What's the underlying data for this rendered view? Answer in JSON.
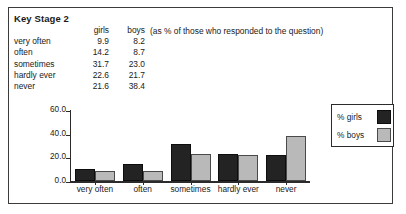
{
  "title": "Key Stage 2",
  "note": "(as % of those who responded to the question)",
  "table": {
    "headers": [
      "",
      "girls",
      "boys"
    ],
    "rows": [
      {
        "label": "very often",
        "girls": "9.9",
        "boys": "8.2"
      },
      {
        "label": "often",
        "girls": "14.2",
        "boys": "8.7"
      },
      {
        "label": "sometimes",
        "girls": "31.7",
        "boys": "23.0"
      },
      {
        "label": "hardly ever",
        "girls": "22.6",
        "boys": "21.7"
      },
      {
        "label": "never",
        "girls": "21.6",
        "boys": "38.4"
      }
    ]
  },
  "legend": {
    "girls_label": "% girls",
    "boys_label": "% boys",
    "girls_color": "#232323",
    "boys_color": "#b9b9b9"
  },
  "chart_data": {
    "type": "bar",
    "title": "Key Stage 2",
    "xlabel": "",
    "ylabel": "",
    "categories": [
      "very often",
      "often",
      "sometimes",
      "hardly ever",
      "never"
    ],
    "series": [
      {
        "name": "% girls",
        "values": [
          9.9,
          14.2,
          31.7,
          22.6,
          21.6
        ],
        "color": "#232323"
      },
      {
        "name": "% boys",
        "values": [
          8.2,
          8.7,
          23.0,
          21.7,
          38.4
        ],
        "color": "#b9b9b9"
      }
    ],
    "ylim": [
      0.0,
      60.0
    ],
    "yticks": [
      "0.0",
      "20.0",
      "40.0",
      "60.0"
    ],
    "ytick_values": [
      0.0,
      20.0,
      40.0,
      60.0
    ],
    "grid": false,
    "legend_position": "top-right"
  }
}
